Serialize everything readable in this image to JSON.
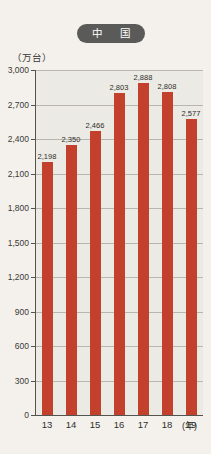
{
  "header": {
    "title": "中　国"
  },
  "axis": {
    "unit_label": "（万台）",
    "x_unit_label": "(年)"
  },
  "chart_data": {
    "type": "bar",
    "title": "中　国",
    "xlabel": "(年)",
    "ylabel": "（万台）",
    "ylim": [
      0,
      3000
    ],
    "ytick_values": [
      0,
      300,
      600,
      900,
      1200,
      1500,
      1800,
      2100,
      2400,
      2700,
      3000
    ],
    "ytick_labels": [
      "0",
      "300",
      "600",
      "900",
      "1,200",
      "1,500",
      "1,800",
      "2,100",
      "2,400",
      "2,700",
      "3,000"
    ],
    "grid": true,
    "legend": false,
    "bar_color": "#c3402c",
    "plot_background": "#eceae4",
    "categories": [
      "13",
      "14",
      "15",
      "16",
      "17",
      "18",
      "19"
    ],
    "values": [
      2198,
      2350,
      2466,
      2803,
      2888,
      2808,
      2577
    ],
    "data_labels": [
      "2,198",
      "2,350",
      "2,466",
      "2,803",
      "2,888",
      "2,808",
      "2,577"
    ]
  }
}
